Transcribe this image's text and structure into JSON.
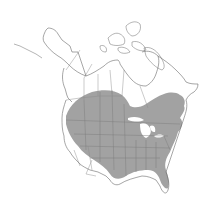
{
  "map": {
    "title": "Range map",
    "region": "North America",
    "projection": "Lambert conformal conic",
    "colors": {
      "background": "#ffffff",
      "land_outline": "#6a6a6a",
      "political_border": "#8a8a8a",
      "range_fill": "#a2a2a2",
      "range_internal_border": "#7c7c7c"
    },
    "layers": [
      {
        "name": "Land outline",
        "type": "coastline"
      },
      {
        "name": "Country and state/province borders",
        "type": "border"
      },
      {
        "name": "Species range",
        "type": "shaded-area"
      }
    ],
    "range_description": "Shaded distribution covering the eastern and central United States, the Great Plains, northern Rocky Mountain states, Pacific Northwest, and southern prairie provinces of Canada; absent from the desert Southwest, California, Alaska, and northern Canada."
  }
}
